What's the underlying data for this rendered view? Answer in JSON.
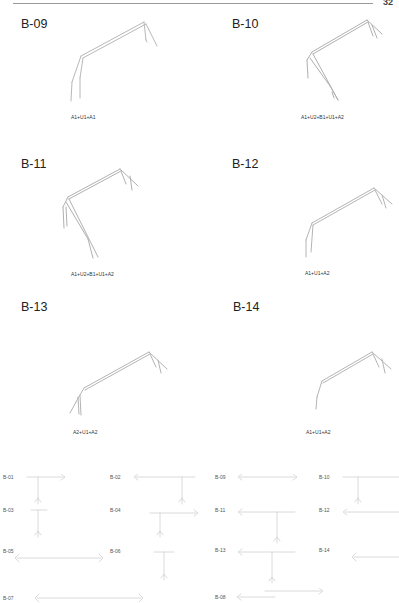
{
  "header": {
    "page_number": "32"
  },
  "figures": [
    {
      "id": "B-09",
      "label": "B-09",
      "caption": "A1+U1+A1"
    },
    {
      "id": "B-10",
      "label": "B-10",
      "caption": "A1+U2+B1+U1+A2"
    },
    {
      "id": "B-11",
      "label": "B-11",
      "caption": "A1+U2+B1+U1+A2"
    },
    {
      "id": "B-12",
      "label": "B-12",
      "caption": "A1+U1+A2"
    },
    {
      "id": "B-13",
      "label": "B-13",
      "caption": "A2+U1+A2"
    },
    {
      "id": "B-14",
      "label": "B-14",
      "caption": "A1+U1+A2"
    }
  ],
  "overview": {
    "left": [
      "B-01",
      "B-02",
      "B-03",
      "B-04",
      "B-05",
      "B-06",
      "B-07"
    ],
    "right": [
      "B-09",
      "B-10",
      "B-11",
      "B-12",
      "B-13",
      "B-14",
      "B-08"
    ]
  }
}
